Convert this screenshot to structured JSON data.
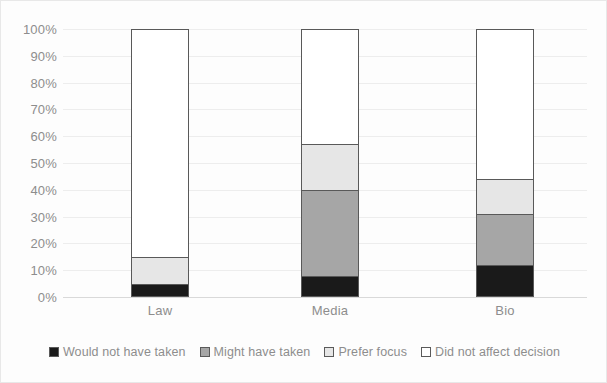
{
  "chart_data": {
    "type": "bar",
    "subtype": "stacked-100-percent",
    "title": "",
    "xlabel": "",
    "ylabel": "",
    "categories": [
      "Law",
      "Media",
      "Bio"
    ],
    "ylim": [
      0,
      100
    ],
    "ytick_labels": [
      "0%",
      "10%",
      "20%",
      "30%",
      "40%",
      "50%",
      "60%",
      "70%",
      "80%",
      "90%",
      "100%"
    ],
    "ytick_values": [
      0,
      10,
      20,
      30,
      40,
      50,
      60,
      70,
      80,
      90,
      100
    ],
    "grid": true,
    "legend_position": "bottom",
    "series": [
      {
        "name": "Would not have taken",
        "color": "#1a1a1a",
        "values": [
          5,
          8,
          12
        ]
      },
      {
        "name": "Might have taken",
        "color": "#a6a6a6",
        "values": [
          0,
          32,
          19
        ]
      },
      {
        "name": "Prefer focus",
        "color": "#e6e6e6",
        "values": [
          10,
          17,
          13
        ]
      },
      {
        "name": "Did not affect decision",
        "color": "#ffffff",
        "values": [
          85,
          43,
          56
        ]
      }
    ]
  },
  "colors": {
    "would_not_have_taken": "#1a1a1a",
    "might_have_taken": "#a6a6a6",
    "prefer_focus": "#e6e6e6",
    "did_not_affect_decision": "#ffffff",
    "gridline": "#ededed",
    "bar_outline": "#595959",
    "tick_text": "#8d8d8d"
  }
}
